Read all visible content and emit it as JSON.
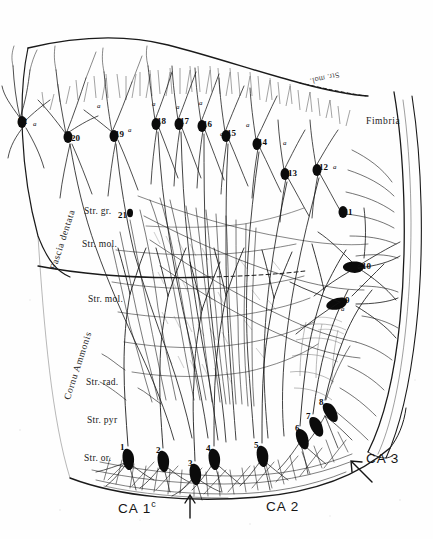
{
  "figure": {
    "ink_color": "#111111",
    "background_color": "#fefefe"
  },
  "regions": {
    "fascia_dentata": "Fascia dentata",
    "cornu_ammonis": "Cornu Ammonis",
    "fimbria": "Fimbria"
  },
  "layers": {
    "str_gr": "Str. gr.",
    "str_mol_dentate": "Str. mol.",
    "str_mol_ammonis": "Str. mol.",
    "str_rad": "Str. rad.",
    "str_pyr": "Str. pyr",
    "str_or": "Str. or.",
    "str_mol_top_mirrored": "Str. mol."
  },
  "subfields": [
    {
      "name": "ca1c",
      "label": "CA 1",
      "superscript": "c"
    },
    {
      "name": "ca2",
      "label": "CA 2",
      "superscript": ""
    },
    {
      "name": "ca3",
      "label": "CA 3",
      "superscript": ""
    }
  ],
  "arrows": [
    {
      "name": "ca1c-ca2-boundary-arrow",
      "direction": "up"
    },
    {
      "name": "ca2-ca3-boundary-arrow",
      "direction": "up-left"
    }
  ],
  "cell_labels": [
    {
      "id": "1",
      "x": 120,
      "y": 443
    },
    {
      "id": "2",
      "x": 156,
      "y": 446
    },
    {
      "id": "3",
      "x": 188,
      "y": 459
    },
    {
      "id": "4",
      "x": 206,
      "y": 444
    },
    {
      "id": "5",
      "x": 254,
      "y": 441
    },
    {
      "id": "6",
      "x": 295,
      "y": 424
    },
    {
      "id": "7",
      "x": 306,
      "y": 412
    },
    {
      "id": "8",
      "x": 319,
      "y": 398
    },
    {
      "id": "9",
      "x": 345,
      "y": 296
    },
    {
      "id": "10",
      "x": 362,
      "y": 262
    },
    {
      "id": "11",
      "x": 344,
      "y": 208
    },
    {
      "id": "12",
      "x": 319,
      "y": 163
    },
    {
      "id": "13",
      "x": 288,
      "y": 169
    },
    {
      "id": "14",
      "x": 258,
      "y": 138
    },
    {
      "id": "15",
      "x": 227,
      "y": 129
    },
    {
      "id": "16",
      "x": 203,
      "y": 120
    },
    {
      "id": "17",
      "x": 180,
      "y": 117
    },
    {
      "id": "18",
      "x": 157,
      "y": 117
    },
    {
      "id": "19",
      "x": 115,
      "y": 130
    },
    {
      "id": "20",
      "x": 71,
      "y": 134
    },
    {
      "id": "21",
      "x": 118,
      "y": 211
    },
    {
      "id": "22",
      "x": 18,
      "y": 117
    }
  ],
  "axon_marks": [
    {
      "id": "a",
      "x": 33,
      "y": 121
    },
    {
      "id": "a",
      "x": 97,
      "y": 103
    },
    {
      "id": "a",
      "x": 128,
      "y": 127
    },
    {
      "id": "a",
      "x": 152,
      "y": 101
    },
    {
      "id": "a",
      "x": 176,
      "y": 104
    },
    {
      "id": "a",
      "x": 199,
      "y": 100
    },
    {
      "id": "a",
      "x": 220,
      "y": 131
    },
    {
      "id": "a",
      "x": 246,
      "y": 122
    },
    {
      "id": "a",
      "x": 283,
      "y": 140
    },
    {
      "id": "a",
      "x": 333,
      "y": 164
    },
    {
      "id": "a",
      "x": 341,
      "y": 306
    }
  ],
  "label_positions": {
    "fascia_dentata": {
      "x": 49,
      "y": 268
    },
    "cornu_ammonis": {
      "x": 63,
      "y": 398
    },
    "fimbria": {
      "x": 366,
      "y": 122
    },
    "str_gr": {
      "x": 84,
      "y": 212
    },
    "str_mol_dentate": {
      "x": 82,
      "y": 245
    },
    "str_mol_ammonis": {
      "x": 88,
      "y": 299
    },
    "str_rad": {
      "x": 86,
      "y": 382
    },
    "str_pyr": {
      "x": 87,
      "y": 420
    },
    "str_or": {
      "x": 84,
      "y": 458
    },
    "str_mol_top": {
      "x": 296,
      "y": 78
    },
    "ca1c": {
      "x": 118,
      "y": 509
    },
    "ca2": {
      "x": 266,
      "y": 509
    },
    "ca3": {
      "x": 366,
      "y": 460
    }
  }
}
